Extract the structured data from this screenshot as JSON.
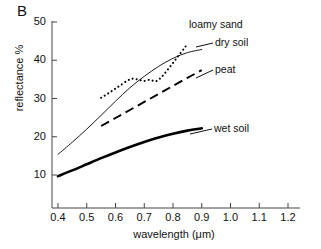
{
  "figure": {
    "panel_label": "B",
    "background_color": "#ffffff",
    "ink_color": "#000000"
  },
  "chart_data": {
    "type": "line",
    "title": "",
    "panel": "B",
    "xlabel": "wavelength (μm)",
    "ylabel": "reflectance %",
    "xlim": [
      0.35,
      1.23
    ],
    "ylim": [
      5,
      50
    ],
    "grid": false,
    "legend_position": "inline-right-of-curves",
    "xticks": [
      0.4,
      0.5,
      0.6,
      0.7,
      0.8,
      0.9,
      1.0,
      1.1,
      1.2
    ],
    "xtick_labels": [
      "0.4",
      "0.5",
      "0.6",
      "0.7",
      "0.8",
      "0.9",
      "1.0",
      "1.1",
      "1.2"
    ],
    "yticks": [
      10,
      20,
      30,
      40,
      50
    ],
    "ytick_labels": [
      "10",
      "20",
      "30",
      "40",
      "50"
    ],
    "series": [
      {
        "name": "dry soil",
        "style": "thin-solid",
        "x": [
          0.4,
          0.45,
          0.5,
          0.55,
          0.6,
          0.65,
          0.7,
          0.75,
          0.8,
          0.85,
          0.9
        ],
        "values": [
          15.4,
          18.6,
          22.0,
          25.6,
          29.3,
          32.8,
          35.8,
          38.4,
          40.5,
          42.0,
          42.8
        ]
      },
      {
        "name": "loamy sand",
        "style": "dotted",
        "x": [
          0.55,
          0.58,
          0.61,
          0.64,
          0.66,
          0.68,
          0.7,
          0.72,
          0.74,
          0.76,
          0.78,
          0.8,
          0.82,
          0.84,
          0.85
        ],
        "values": [
          30.2,
          31.6,
          33.1,
          34.6,
          35.2,
          34.9,
          34.6,
          34.9,
          34.5,
          35.6,
          37.4,
          39.3,
          41.3,
          43.2,
          44.4
        ]
      },
      {
        "name": "peat",
        "style": "dashed",
        "x": [
          0.55,
          0.6,
          0.65,
          0.7,
          0.75,
          0.8,
          0.85,
          0.9
        ],
        "values": [
          22.8,
          24.9,
          27.0,
          29.1,
          31.2,
          33.3,
          35.4,
          37.4
        ]
      },
      {
        "name": "wet soil",
        "style": "thick-solid",
        "x": [
          0.4,
          0.45,
          0.5,
          0.55,
          0.6,
          0.65,
          0.7,
          0.75,
          0.8,
          0.85,
          0.9
        ],
        "values": [
          9.7,
          11.2,
          12.8,
          14.4,
          15.9,
          17.3,
          18.6,
          19.8,
          20.8,
          21.6,
          22.2
        ]
      }
    ],
    "annotations": [
      {
        "text": "loamy sand",
        "for": "loamy sand"
      },
      {
        "text": "dry soil",
        "for": "dry soil"
      },
      {
        "text": "peat",
        "for": "peat"
      },
      {
        "text": "wet soil",
        "for": "wet soil"
      }
    ]
  }
}
